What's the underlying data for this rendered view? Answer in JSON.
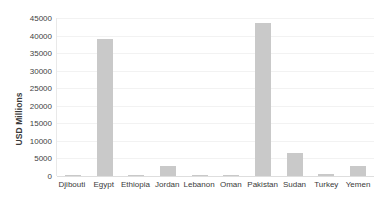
{
  "chart_data": {
    "type": "bar",
    "title": "",
    "subtitle": "",
    "xlabel": "",
    "ylabel": "USD Millions",
    "ylim": [
      0,
      45000
    ],
    "ytick_step": 5000,
    "yticks": [
      45000,
      40000,
      35000,
      30000,
      25000,
      20000,
      15000,
      10000,
      5000,
      0
    ],
    "ytick_labels": [
      "45000",
      "40000",
      "35000",
      "30000",
      "25000",
      "20000",
      "15000",
      "10000",
      "5000",
      "0"
    ],
    "categories": [
      "Djibouti",
      "Egypt",
      "Ethiopia",
      "Jordan",
      "Lebanon",
      "Oman",
      "Pakistan",
      "Sudan",
      "Turkey",
      "Yemen"
    ],
    "values": [
      180,
      39000,
      250,
      2900,
      60,
      300,
      43500,
      6500,
      700,
      2900
    ],
    "legend": [],
    "legend_position": "none",
    "grid": true,
    "bar_color": "#c9c9c9",
    "gridline_color": "#f2f2f2",
    "axis_color": "#dedede",
    "background_color": "#ffffff",
    "text_color": "#3a3a3a"
  }
}
